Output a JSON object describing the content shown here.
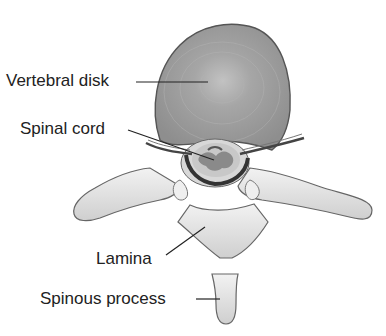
{
  "diagram": {
    "labels": {
      "vertebral_disk": "Vertebral disk",
      "spinal_cord": "Spinal cord",
      "lamina": "Lamina",
      "spinous_process": "Spinous process"
    },
    "colors": {
      "disk_fill": "#9a9a9a",
      "bone_fill": "#e4e4e4",
      "outline": "#555555",
      "cord_dark": "#3a3a3a",
      "cord_gray": "#8a8a8a",
      "leader_line": "#222222",
      "text": "#222222"
    }
  }
}
